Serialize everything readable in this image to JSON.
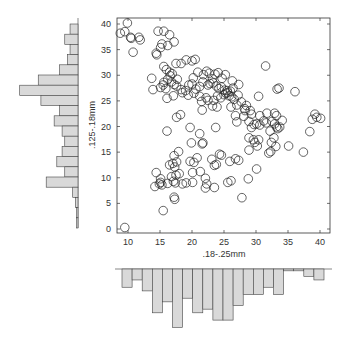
{
  "chart_data": {
    "type": "scatter",
    "title": "",
    "xlabel": ".18-.25mm",
    "ylabel": ".125-.18mm",
    "xlim": [
      8,
      41
    ],
    "ylim": [
      -1,
      41
    ],
    "x_ticks": [
      10,
      15,
      20,
      25,
      30,
      35,
      40
    ],
    "y_ticks": [
      0,
      5,
      10,
      15,
      20,
      25,
      30,
      35,
      40
    ],
    "marker": "open-circle",
    "grid": false,
    "points": [
      [
        9.5,
        0.3
      ],
      [
        15.5,
        3.6
      ],
      [
        17.2,
        6.2
      ],
      [
        17.3,
        5.8
      ],
      [
        27.8,
        6.1
      ],
      [
        14.2,
        8.3
      ],
      [
        14.9,
        8.8
      ],
      [
        15.1,
        9.1
      ],
      [
        15.3,
        8.6
      ],
      [
        16.2,
        8.9
      ],
      [
        17.1,
        9.3
      ],
      [
        17.4,
        9.0
      ],
      [
        18.5,
        8.8
      ],
      [
        19.1,
        9.0
      ],
      [
        20.1,
        9.1
      ],
      [
        22.1,
        8.0
      ],
      [
        22.3,
        8.8
      ],
      [
        23.5,
        8.1
      ],
      [
        25.6,
        9.1
      ],
      [
        26.1,
        9.4
      ],
      [
        28.8,
        9.8
      ],
      [
        14.4,
        11.0
      ],
      [
        15.1,
        9.8
      ],
      [
        16.8,
        10.2
      ],
      [
        17.5,
        10.5
      ],
      [
        18.0,
        10.8
      ],
      [
        20.1,
        11.0
      ],
      [
        21.3,
        11.2
      ],
      [
        22.1,
        9.9
      ],
      [
        30.1,
        11.7
      ],
      [
        16.5,
        12.5
      ],
      [
        17.0,
        12.8
      ],
      [
        17.3,
        12.1
      ],
      [
        17.6,
        13.1
      ],
      [
        19.7,
        13.2
      ],
      [
        20.3,
        13.0
      ],
      [
        20.8,
        13.9
      ],
      [
        23.1,
        13.6
      ],
      [
        23.5,
        12.4
      ],
      [
        23.8,
        12.6
      ],
      [
        24.3,
        14.6
      ],
      [
        24.6,
        14.4
      ],
      [
        25.9,
        13.2
      ],
      [
        26.8,
        13.7
      ],
      [
        27.3,
        13.4
      ],
      [
        17.2,
        14.3
      ],
      [
        17.9,
        15.1
      ],
      [
        19.9,
        16.8
      ],
      [
        21.6,
        16.6
      ],
      [
        21.7,
        16.8
      ],
      [
        28.9,
        15.4
      ],
      [
        29.8,
        16.9
      ],
      [
        30.2,
        16.2
      ],
      [
        32.0,
        14.8
      ],
      [
        32.3,
        15.1
      ],
      [
        32.4,
        16.9
      ],
      [
        33.1,
        16.1
      ],
      [
        35.1,
        16.2
      ],
      [
        37.4,
        15.0
      ],
      [
        16.1,
        19.1
      ],
      [
        19.7,
        19.8
      ],
      [
        21.2,
        18.6
      ],
      [
        23.7,
        19.8
      ],
      [
        28.9,
        17.8
      ],
      [
        29.3,
        19.8
      ],
      [
        29.6,
        17.4
      ],
      [
        30.4,
        17.4
      ],
      [
        32.2,
        19.1
      ],
      [
        32.8,
        17.8
      ],
      [
        33.2,
        19.9
      ],
      [
        33.7,
        19.9
      ],
      [
        38.4,
        19.0
      ],
      [
        17.6,
        21.8
      ],
      [
        18.2,
        22.3
      ],
      [
        27.0,
        20.9
      ],
      [
        28.1,
        22.0
      ],
      [
        28.9,
        21.0
      ],
      [
        29.7,
        20.4
      ],
      [
        30.1,
        20.5
      ],
      [
        30.6,
        20.3
      ],
      [
        31.2,
        21.1
      ],
      [
        31.6,
        20.7
      ],
      [
        32.5,
        21.0
      ],
      [
        32.9,
        20.5
      ],
      [
        33.4,
        19.6
      ],
      [
        34.1,
        21.2
      ],
      [
        38.8,
        21.4
      ],
      [
        39.5,
        21.8
      ],
      [
        40.1,
        21.6
      ],
      [
        39.2,
        22.4
      ],
      [
        21.6,
        23.2
      ],
      [
        23.2,
        24.0
      ],
      [
        23.9,
        23.8
      ],
      [
        26.1,
        23.8
      ],
      [
        26.8,
        22.1
      ],
      [
        27.0,
        24.2
      ],
      [
        28.3,
        23.1
      ],
      [
        29.1,
        23.1
      ],
      [
        29.3,
        22.4
      ],
      [
        30.6,
        22.1
      ],
      [
        31.7,
        22.6
      ],
      [
        32.9,
        22.6
      ],
      [
        33.2,
        22.1
      ],
      [
        16.1,
        25.5
      ],
      [
        17.1,
        26.0
      ],
      [
        18.5,
        26.6
      ],
      [
        19.4,
        26.1
      ],
      [
        20.3,
        26.5
      ],
      [
        21.2,
        25.9
      ],
      [
        21.5,
        24.9
      ],
      [
        22.2,
        25.6
      ],
      [
        22.5,
        25.1
      ],
      [
        23.4,
        25.1
      ],
      [
        24.0,
        26.0
      ],
      [
        24.5,
        25.6
      ],
      [
        25.0,
        26.2
      ],
      [
        25.3,
        26.5
      ],
      [
        25.8,
        26.0
      ],
      [
        26.2,
        25.8
      ],
      [
        26.6,
        25.3
      ],
      [
        27.2,
        26.1
      ],
      [
        27.7,
        24.8
      ],
      [
        28.5,
        24.1
      ],
      [
        28.2,
        23.5
      ],
      [
        30.4,
        25.9
      ],
      [
        33.3,
        27.3
      ],
      [
        33.6,
        27.5
      ],
      [
        36.1,
        26.8
      ],
      [
        13.9,
        27.2
      ],
      [
        15.1,
        27.6
      ],
      [
        15.5,
        28.1
      ],
      [
        15.9,
        27.4
      ],
      [
        16.8,
        28.7
      ],
      [
        17.2,
        28.2
      ],
      [
        17.6,
        27.9
      ],
      [
        18.3,
        27.2
      ],
      [
        19.0,
        27.0
      ],
      [
        19.5,
        28.1
      ],
      [
        20.0,
        28.3
      ],
      [
        20.6,
        27.3
      ],
      [
        21.2,
        27.8
      ],
      [
        21.7,
        28.7
      ],
      [
        22.5,
        28.1
      ],
      [
        22.8,
        28.4
      ],
      [
        23.3,
        28.5
      ],
      [
        23.8,
        27.9
      ],
      [
        24.2,
        27.4
      ],
      [
        24.6,
        27.7
      ],
      [
        25.1,
        27.1
      ],
      [
        25.5,
        27.0
      ],
      [
        25.6,
        26.6
      ],
      [
        26.0,
        26.9
      ],
      [
        26.4,
        27.5
      ],
      [
        13.7,
        29.4
      ],
      [
        15.6,
        28.6
      ],
      [
        16.2,
        29.2
      ],
      [
        16.6,
        29.9
      ],
      [
        17.7,
        29.2
      ],
      [
        20.2,
        29.5
      ],
      [
        20.9,
        30.6
      ],
      [
        21.8,
        30.1
      ],
      [
        22.3,
        30.8
      ],
      [
        22.7,
        30.4
      ],
      [
        23.2,
        29.3
      ],
      [
        23.6,
        30.2
      ],
      [
        24.1,
        30.5
      ],
      [
        24.7,
        29.4
      ],
      [
        25.2,
        30.1
      ],
      [
        26.3,
        28.9
      ],
      [
        27.3,
        28.2
      ],
      [
        31.5,
        31.8
      ],
      [
        15.6,
        31.7
      ],
      [
        16.0,
        31.1
      ],
      [
        16.5,
        30.6
      ],
      [
        16.9,
        30.3
      ],
      [
        17.5,
        32.3
      ],
      [
        18.3,
        32.3
      ],
      [
        19.1,
        33.0
      ],
      [
        20.0,
        32.8
      ],
      [
        20.5,
        33.1
      ],
      [
        14.4,
        34.3
      ],
      [
        14.5,
        34.0
      ],
      [
        15.1,
        35.4
      ],
      [
        15.3,
        36.1
      ],
      [
        16.2,
        35.8
      ],
      [
        17.2,
        36.5
      ],
      [
        10.8,
        34.5
      ],
      [
        8.8,
        38.2
      ],
      [
        9.5,
        38.5
      ],
      [
        9.9,
        40.2
      ],
      [
        10.4,
        37.4
      ],
      [
        10.5,
        37.2
      ],
      [
        11.7,
        37.4
      ],
      [
        11.9,
        36.9
      ],
      [
        14.7,
        38.6
      ],
      [
        15.6,
        38.6
      ],
      [
        16.5,
        37.9
      ]
    ],
    "marginal_x_histogram": {
      "orientation": "downward",
      "bin_edges_approx": [
        9.5,
        41.5
      ],
      "bins": 22,
      "values": [
        5,
        3,
        6,
        12,
        9,
        16,
        8,
        12,
        11,
        14,
        14,
        10,
        7,
        7,
        5,
        7,
        0.5,
        0.5,
        2,
        3
      ]
    },
    "marginal_y_histogram": {
      "orientation": "leftward",
      "bin_edges_approx": [
        0,
        41
      ],
      "bins": 20,
      "values_from_top": [
        3,
        5,
        3,
        4,
        7,
        15,
        22,
        14,
        7,
        9,
        6,
        5,
        6,
        8,
        5,
        12,
        2,
        1,
        0.5,
        0.5
      ]
    }
  }
}
